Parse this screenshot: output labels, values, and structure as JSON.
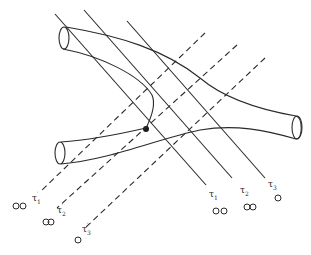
{
  "figure": {
    "solid_slices": [
      {
        "symbol": "τ",
        "sub": "1",
        "prime": "",
        "loops": "OO"
      },
      {
        "symbol": "τ",
        "sub": "2",
        "prime": "",
        "loops": "OO"
      },
      {
        "symbol": "τ",
        "sub": "3",
        "prime": "",
        "loops": "O"
      }
    ],
    "dashed_slices": [
      {
        "symbol": "τ",
        "sub": "1",
        "prime": "′",
        "loops": "OO"
      },
      {
        "symbol": "τ",
        "sub": "2",
        "prime": "′",
        "loops": "OO"
      },
      {
        "symbol": "τ",
        "sub": "3",
        "prime": "′",
        "loops": "O"
      }
    ],
    "interaction_point": "filled-dot",
    "colors": {
      "ink": "#2a2a2a",
      "background": "#ffffff"
    }
  }
}
